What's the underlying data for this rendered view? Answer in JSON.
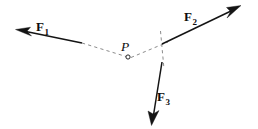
{
  "figure": {
    "kind": "force-vector-diagram",
    "width": 258,
    "height": 129,
    "background_color": "#ffffff",
    "vector_color": "#141414",
    "dashed_color": "#8c8c8c",
    "point_color": "#242424"
  },
  "point": {
    "name": "P",
    "label": "P",
    "x": 128,
    "y": 57,
    "marker": "open-circle",
    "marker_radius": 2.1
  },
  "vectors": [
    {
      "id": "F1",
      "label_base": "F",
      "label_sub": "1",
      "label_text": "F1",
      "direction": "up-left",
      "tail_x": 82,
      "tail_y": 43,
      "tip_x": 16,
      "tip_y": 30,
      "label_x": 36,
      "label_y": 20
    },
    {
      "id": "F2",
      "label_base": "F",
      "label_sub": "2",
      "label_text": "F2",
      "direction": "up-right",
      "tail_x": 162,
      "tail_y": 44,
      "tip_x": 241,
      "tip_y": 6,
      "label_x": 184,
      "label_y": 10
    },
    {
      "id": "F3",
      "label_base": "F",
      "label_sub": "3",
      "label_text": "F3",
      "direction": "down",
      "tail_x": 162,
      "tail_y": 62,
      "tip_x": 152,
      "tip_y": 125,
      "label_x": 157,
      "label_y": 90
    }
  ],
  "construction_lines": [
    {
      "id": "line-of-action-f1",
      "style": "dashed",
      "x1": 82,
      "y1": 43,
      "x2": 128,
      "y2": 57
    },
    {
      "id": "line-p-to-f2",
      "style": "dashed",
      "x1": 128,
      "y1": 57,
      "x2": 167,
      "y2": 43
    },
    {
      "id": "vertical-guide",
      "style": "dashed",
      "x1": 161,
      "y1": 31,
      "x2": 164,
      "y2": 69
    }
  ]
}
